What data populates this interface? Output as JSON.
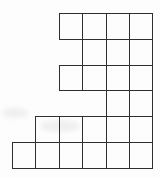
{
  "figure": {
    "background_color": "#fdfdfd",
    "line_color": "#2f2f2f",
    "line_width_px": 1,
    "grid": {
      "origin_x": 12,
      "origin_y": 13,
      "cell_width": 23.4,
      "cell_height": 25.8,
      "total_columns": 6,
      "total_rows": 6,
      "rows": [
        {
          "row": 0,
          "start_col": 2,
          "end_col": 5,
          "square_count": 4
        },
        {
          "row": 1,
          "start_col": 3,
          "end_col": 5,
          "square_count": 3
        },
        {
          "row": 2,
          "start_col": 2,
          "end_col": 5,
          "square_count": 4
        },
        {
          "row": 3,
          "start_col": 4,
          "end_col": 5,
          "square_count": 2
        },
        {
          "row": 4,
          "start_col": 1,
          "end_col": 5,
          "square_count": 5
        },
        {
          "row": 5,
          "start_col": 0,
          "end_col": 5,
          "square_count": 6
        }
      ],
      "total_squares": 24
    }
  }
}
